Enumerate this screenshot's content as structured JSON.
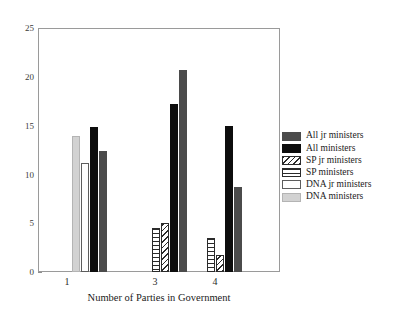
{
  "chart_data": {
    "type": "bar",
    "title": "",
    "subtitle": "",
    "xlabel": "Number of Parties in Government",
    "ylabel": "",
    "categories": [
      "1",
      "3",
      "4"
    ],
    "xtick_labels": [
      "1",
      "3",
      "4"
    ],
    "ytick_labels": [
      "0",
      "5",
      "10",
      "15",
      "20",
      "25"
    ],
    "ytick_values": [
      0,
      5,
      10,
      15,
      20,
      25
    ],
    "ylim": [
      0,
      25
    ],
    "grid": false,
    "legend_position": "right",
    "series": [
      {
        "name": "All jr ministers",
        "key": "all_jr_ministers",
        "color": "#4b4b4b",
        "fill": "solid-dark-gray",
        "values": [
          12.5,
          20.8,
          8.7
        ]
      },
      {
        "name": "All ministers",
        "key": "all_ministers",
        "color": "#0d0d0d",
        "fill": "solid-black",
        "values": [
          14.9,
          17.3,
          15.0
        ]
      },
      {
        "name": "SP jr ministers",
        "key": "sp_jr_ministers",
        "color": "#2b2b2b",
        "fill": "diagonal-hatch",
        "values": [
          0,
          5.0,
          1.8
        ]
      },
      {
        "name": "SP ministers",
        "key": "sp_ministers",
        "color": "#2b2b2b",
        "fill": "horizontal-lines",
        "values": [
          0,
          4.5,
          3.5
        ]
      },
      {
        "name": "DNA jr ministers",
        "key": "dna_jr_ministers",
        "color": "#ffffff",
        "fill": "white-outline",
        "values": [
          11.2,
          0,
          0
        ]
      },
      {
        "name": "DNA ministers",
        "key": "dna_ministers",
        "color": "#d2d2d2",
        "fill": "light-gray",
        "values": [
          14.0,
          0,
          0
        ]
      }
    ]
  },
  "legend": {
    "items": [
      {
        "label": "All jr ministers"
      },
      {
        "label": "All ministers"
      },
      {
        "label": "SP jr ministers"
      },
      {
        "label": "SP ministers"
      },
      {
        "label": "DNA jr ministers"
      },
      {
        "label": "DNA ministers"
      }
    ]
  },
  "axes": {
    "x_title": "Number of Parties in Government",
    "y_ticks": [
      "25",
      "20",
      "15",
      "10",
      "5",
      "0"
    ],
    "x_ticks": [
      "1",
      "3",
      "4"
    ]
  }
}
